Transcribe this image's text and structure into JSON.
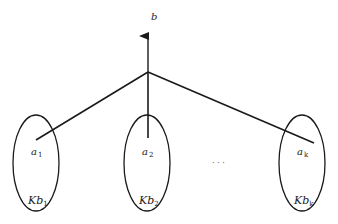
{
  "diagram": {
    "type": "tree",
    "stroke_color": "#1a1a1a",
    "background": "#ffffff",
    "root": {
      "label": "b",
      "apex": [
        148,
        72
      ],
      "arrow_tip": [
        148,
        28
      ],
      "label_pos": [
        151,
        20
      ]
    },
    "nodes": [
      {
        "id": "node-1",
        "element_label": "a",
        "element_sub": "1",
        "set_label": "Kb",
        "set_sub": "1",
        "ellipse": {
          "cx": 36,
          "cy": 163,
          "rx": 23,
          "ry": 48
        },
        "edge_end": [
          36,
          140
        ],
        "element_pos": [
          31,
          155
        ],
        "set_pos": [
          28,
          204
        ]
      },
      {
        "id": "node-2",
        "element_label": "a",
        "element_sub": "2",
        "set_label": "Kb",
        "set_sub": "2",
        "ellipse": {
          "cx": 147,
          "cy": 163,
          "rx": 23,
          "ry": 48
        },
        "edge_end": [
          148,
          138
        ],
        "element_pos": [
          142,
          155
        ],
        "set_pos": [
          139,
          204
        ]
      },
      {
        "id": "node-k",
        "element_label": "a",
        "element_sub": "k",
        "set_label": "Kb",
        "set_sub": "k",
        "ellipse": {
          "cx": 302,
          "cy": 163,
          "rx": 23,
          "ry": 48
        },
        "edge_end": [
          314,
          143
        ],
        "element_pos": [
          297,
          155
        ],
        "set_pos": [
          294,
          204
        ]
      }
    ],
    "ellipsis": {
      "text": "· · ·",
      "pos": [
        212,
        166
      ]
    }
  }
}
